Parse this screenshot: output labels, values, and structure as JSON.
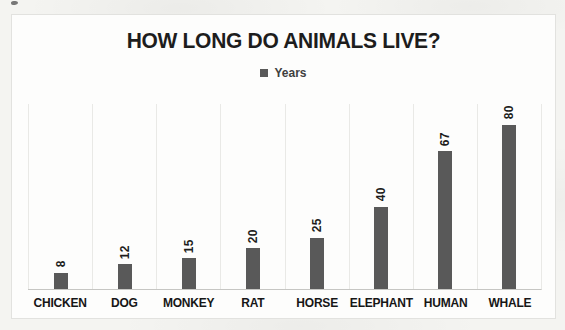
{
  "chart_data": {
    "type": "bar",
    "title": "HOW LONG DO ANIMALS LIVE?",
    "series_name": "Years",
    "legend_position": "top-center",
    "categories": [
      "CHICKEN",
      "DOG",
      "MONKEY",
      "RAT",
      "HORSE",
      "ELEPHANT",
      "HUMAN",
      "WHALE"
    ],
    "values": [
      8,
      12,
      15,
      20,
      25,
      40,
      67,
      80
    ],
    "ylim": [
      0,
      90
    ],
    "grid": "vertical-category-boundaries",
    "data_labels": {
      "rotation": -90,
      "position": "above-bar"
    },
    "xlabel": "",
    "ylabel": "",
    "colors": {
      "bar": "#595959",
      "title": "#1d1d1d",
      "label": "#1d1d1d",
      "grid": "#e9e9e6",
      "axis": "#c6c6c3",
      "border": "#e2e2df",
      "chart_bg": "#fdfdfc",
      "page_bg": "#f4f4f1"
    }
  }
}
